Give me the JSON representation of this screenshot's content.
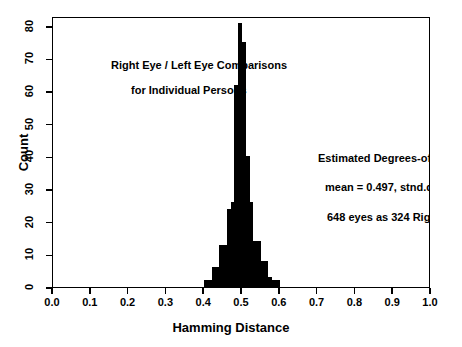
{
  "chart_data": {
    "type": "bar",
    "title": "Right Eye / Left Eye Comparisons for Individual Persons",
    "xlabel": "Hamming Distance",
    "ylabel": "Count",
    "xlim": [
      0.0,
      1.0
    ],
    "ylim": [
      0,
      83
    ],
    "grid": false,
    "legend": null,
    "bin_width": 0.01,
    "bar_color": "#000000",
    "xticks": [
      0.0,
      0.1,
      0.2,
      0.3,
      0.4,
      0.5,
      0.6,
      0.7,
      0.8,
      0.9,
      1.0
    ],
    "xtick_labels": [
      "0.0",
      "0.1",
      "0.2",
      "0.3",
      "0.4",
      "0.5",
      "0.6",
      "0.7",
      "0.8",
      "0.9",
      "1.0"
    ],
    "yticks": [
      0,
      10,
      20,
      30,
      40,
      50,
      60,
      70,
      80
    ],
    "ytick_labels": [
      "0",
      "10",
      "20",
      "30",
      "40",
      "50",
      "60",
      "70",
      "80"
    ],
    "categories": [
      0.405,
      0.415,
      0.425,
      0.435,
      0.445,
      0.455,
      0.465,
      0.475,
      0.485,
      0.495,
      0.505,
      0.515,
      0.525,
      0.535,
      0.545,
      0.555,
      0.565,
      0.575,
      0.585,
      0.595
    ],
    "bin_edges": [
      0.4,
      0.41,
      0.42,
      0.43,
      0.44,
      0.45,
      0.46,
      0.47,
      0.48,
      0.49,
      0.5,
      0.51,
      0.52,
      0.53,
      0.54,
      0.55,
      0.56,
      0.57,
      0.58,
      0.59,
      0.6
    ],
    "values": [
      2,
      2,
      6,
      6,
      13,
      13,
      24,
      26,
      62,
      81,
      75,
      40,
      26,
      14,
      14,
      8,
      8,
      3,
      2,
      2
    ],
    "annotations": {
      "title_line_1": "Right Eye / Left Eye Comparisons",
      "title_line_2": "for Individual Persons",
      "note_line_1": "Estimated Degrees-of-Freedom: 259",
      "note_line_2": "mean = 0.497,  stnd.dev. = 0.03108",
      "note_line_3": "648 eyes as 324 Right/Left pairs"
    },
    "stats": {
      "degrees_of_freedom": 259,
      "mean": 0.497,
      "std_dev": 0.03108,
      "total_eyes": 648,
      "pairs": 324
    }
  }
}
